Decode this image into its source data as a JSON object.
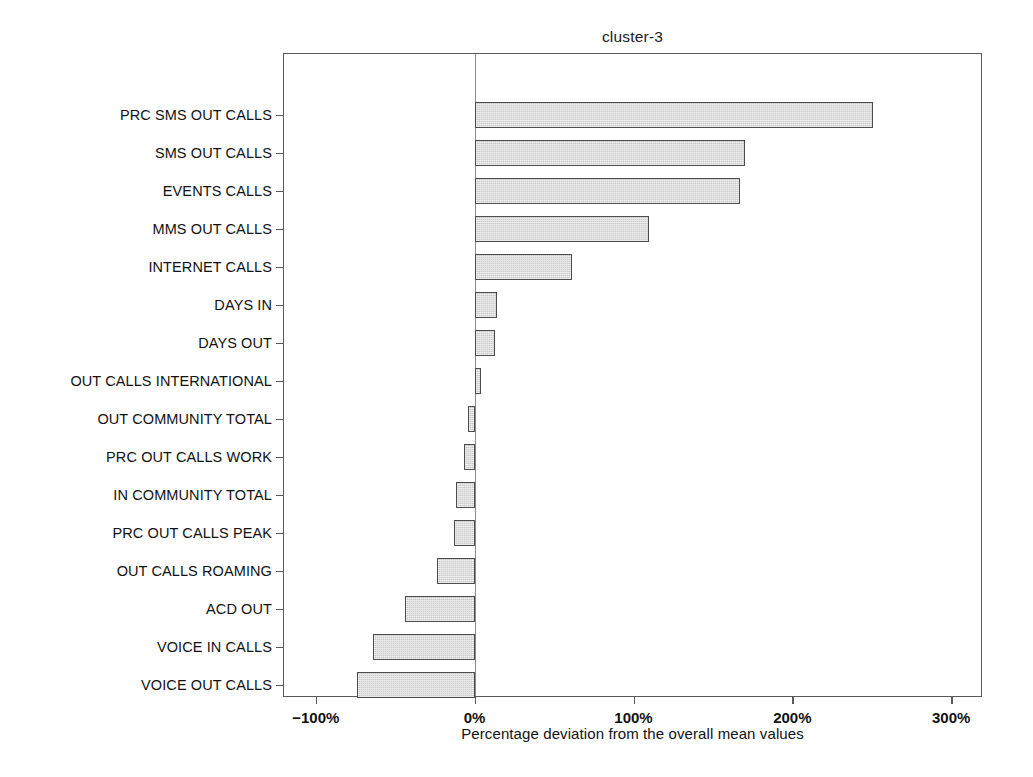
{
  "chart_data": {
    "type": "bar",
    "orientation": "horizontal",
    "title": "cluster-3",
    "xlabel": "Percentage deviation from the overall mean values",
    "ylabel": "",
    "xlim": [
      -120,
      320
    ],
    "xticks": [
      -100,
      0,
      100,
      200,
      300
    ],
    "xticklabels": [
      "−100%",
      "0%",
      "100%",
      "200%",
      "300%"
    ],
    "grid": false,
    "legend": null,
    "zero_reference_line": 0,
    "bar_color": "#c9c9c9",
    "bar_edge_color": "#4c4c4c",
    "categories": [
      "PRC SMS OUT CALLS",
      "SMS OUT CALLS",
      "EVENTS CALLS",
      "MMS OUT CALLS",
      "INTERNET CALLS",
      "DAYS IN",
      "DAYS OUT",
      "OUT CALLS INTERNATIONAL",
      "OUT COMMUNITY TOTAL",
      "PRC OUT CALLS WORK",
      "IN COMMUNITY TOTAL",
      "PRC OUT CALLS PEAK",
      "OUT CALLS ROAMING",
      "ACD OUT",
      "VOICE IN CALLS",
      "VOICE OUT CALLS"
    ],
    "values": [
      251,
      170,
      167,
      110,
      61,
      14,
      13,
      4,
      -4,
      -7,
      -12,
      -13,
      -24,
      -44,
      -64,
      -74
    ]
  }
}
